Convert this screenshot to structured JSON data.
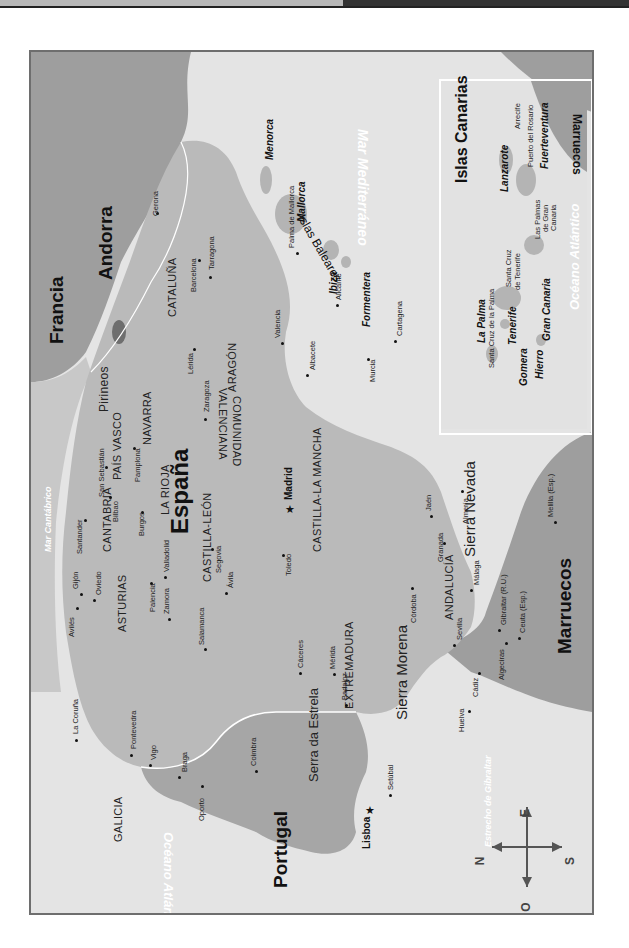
{
  "map": {
    "title": "España",
    "orientation": "rotated 90° counter-clockwise (north points left)",
    "colors": {
      "sea": "#e6e6e6",
      "spain_land": "#bdbdbd",
      "portugal_land": "#a8a8a8",
      "foreign_land": "#9a9a9a",
      "frame_border": "#6e6e6e",
      "border_line": "#ffffff"
    },
    "countries": {
      "spain": "España",
      "portugal": "Portugal",
      "france": "Francia",
      "andorra": "Andorra",
      "morocco": "Marruecos",
      "morocco_inset": "Marruecos"
    },
    "seas": {
      "cantabrico": "Mar Cantábrico",
      "mediterraneo": "Mar Mediterráneo",
      "atlantico": "Océano Atlántico",
      "atlantico_inset": "Océano Atlántico",
      "gibraltar": "Estrecho de Gibraltar"
    },
    "mountains": {
      "pirineos": "Pirineos",
      "sierra_morena": "Sierra Morena",
      "sierra_nevada": "Sierra Nevada",
      "serra_estrela": "Serra da Estrela"
    },
    "regions": {
      "galicia": "GALICIA",
      "asturias": "ASTURIAS",
      "cantabria": "CANTABRIA",
      "pais_vasco": "PAÍS VASCO",
      "navarra": "NAVARRA",
      "la_rioja": "LA RIOJA",
      "aragon": "ARAGÓN",
      "cataluna": "CATALUÑA",
      "castilla_leon": "CASTILLA-LEÓN",
      "castilla_la_mancha": "CASTILLA-LA MANCHA",
      "comunidad": "COMUNIDAD",
      "valenciana": "VALENCIANA",
      "extremadura": "EXTREMADURA",
      "andalucia": "ANDALUCÍA"
    },
    "capitals": {
      "madrid": "Madrid",
      "lisboa": "Lisboa"
    },
    "cities": {
      "gerona": "Gerona",
      "barcelona": "Barcelona",
      "tarragona": "Tarragona",
      "lerida": "Lérida",
      "zaragoza": "Zaragoza",
      "pamplona": "Pamplona",
      "san_sebastian": "San Sebastián",
      "bilbao": "Bilbao",
      "santander": "Santander",
      "oviedo": "Oviedo",
      "gijon": "Gijón",
      "aviles": "Avilés",
      "la_coruna": "La Coruña",
      "pontevedra": "Pontevedra",
      "vigo": "Vigo",
      "burgos": "Burgos",
      "palencia": "Palencia",
      "valladolid": "Valladolid",
      "zamora": "Zamora",
      "salamanca": "Salamanca",
      "segovia": "Segovia",
      "avila": "Ávila",
      "toledo": "Toledo",
      "caceres": "Cáceres",
      "merida": "Mérida",
      "badajoz": "Badajoz",
      "valencia": "Valencia",
      "alicante": "Alicante",
      "albacete": "Albacete",
      "murcia": "Murcia",
      "cartagena": "Cartagena",
      "almeria": "Almería",
      "granada": "Granada",
      "jaen": "Jaén",
      "cordoba": "Córdoba",
      "sevilla": "Sevilla",
      "huelva": "Huelva",
      "cadiz": "Cádiz",
      "malaga": "Málaga",
      "algeciras": "Algeciras",
      "gibraltar": "Gibraltar (R.U.)",
      "ceuta": "Ceuta (Esp.)",
      "melilla": "Melilla (Esp.)",
      "braga": "Braga",
      "oporto": "Oporto",
      "coimbra": "Coimbra",
      "setubal": "Setúbal",
      "palma": "Palma de Mallorca"
    },
    "balearics": {
      "group": "Islas Baleares",
      "menorca": "Menorca",
      "mallorca": "Mallorca",
      "ibiza": "Ibiza",
      "formentera": "Formentera"
    },
    "canarias": {
      "title": "Islas Canarias",
      "la_palma": "La Palma",
      "santa_cruz_palma": "Santa Cruz de la Palma",
      "tenerife": "Tenerife",
      "santa_cruz_tenerife_1": "Santa Cruz",
      "santa_cruz_tenerife_2": "de Tenerife",
      "gomera": "Gomera",
      "hierro": "Hierro",
      "gran_canaria": "Gran Canaria",
      "las_palmas_1": "Las Palmas",
      "las_palmas_2": "de Gran",
      "las_palmas_3": "Canaria",
      "lanzarote": "Lanzarote",
      "arrecife": "Arrecife",
      "fuerteventura": "Fuerteventura",
      "puerto_rosario": "Puerto del Rosario"
    },
    "compass": {
      "n": "N",
      "s": "S",
      "e": "E",
      "o": "O"
    }
  }
}
